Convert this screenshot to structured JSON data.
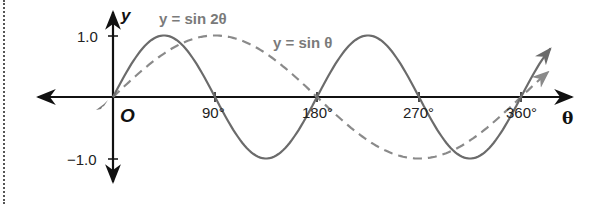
{
  "chart_data": {
    "type": "line",
    "title": "",
    "xlabel": "θ",
    "ylabel": "y",
    "origin_label": "O",
    "xlim": [
      -70,
      410
    ],
    "ylim": [
      -1.3,
      1.4
    ],
    "x_ticks": [
      90,
      180,
      270,
      360
    ],
    "x_tick_labels": [
      "90°",
      "180°",
      "270°",
      "360°"
    ],
    "y_ticks": [
      1.0,
      -1.0
    ],
    "y_tick_labels": [
      "1.0",
      "−1.0"
    ],
    "grid": false,
    "legend": "inline labels",
    "series": [
      {
        "name": "y = sin 2θ",
        "style": "solid",
        "color": "#6b6b6b",
        "x": [
          0,
          45,
          90,
          135,
          180,
          225,
          270,
          315,
          360,
          387
        ],
        "values": [
          0,
          1.0,
          0,
          -1.0,
          0,
          1.0,
          0,
          -1.0,
          0,
          0.81
        ]
      },
      {
        "name": "y = sin θ",
        "style": "dashed",
        "color": "#888888",
        "x": [
          0,
          90,
          180,
          270,
          360,
          385
        ],
        "values": [
          0,
          1.0,
          0,
          -1.0,
          0,
          0.42
        ]
      }
    ],
    "annotations": [
      {
        "text": "y = sin 2θ",
        "near_x": 80,
        "near_y": 1.2
      },
      {
        "text": "y = sin θ",
        "near_x": 180,
        "near_y": 0.85
      }
    ]
  },
  "labels": {
    "y_axis": "y",
    "x_axis": "θ",
    "origin": "O",
    "x_ticks": [
      "90°",
      "180°",
      "270°",
      "360°"
    ],
    "y_pos": "1.0",
    "y_neg": "−1.0",
    "series_sin2": "y = sin 2θ",
    "series_sin": "y = sin θ"
  },
  "colors": {
    "axis": "#111111",
    "sin2": "#6b6b6b",
    "sin": "#8a8a8a",
    "label": "#7a7a7a"
  }
}
